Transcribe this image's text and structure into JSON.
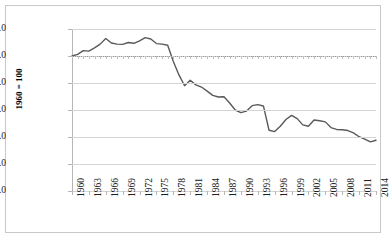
{
  "chart_data": {
    "type": "line",
    "title": "",
    "subtitle": "",
    "xlabel": "",
    "ylabel": "1960 = 100",
    "ylim": [
      50.0,
      110.0
    ],
    "xlim": [
      1960,
      2014
    ],
    "grid": true,
    "legend": false,
    "legend_position": "none",
    "ytick_labels": [
      "110.0",
      "100.0",
      "90.0",
      "80.0",
      "70.0",
      "60.0",
      "50.0"
    ],
    "ytick_values": [
      110.0,
      100.0,
      90.0,
      80.0,
      70.0,
      60.0,
      50.0
    ],
    "xtick_labels": [
      "1960",
      "1963",
      "1966",
      "1969",
      "1972",
      "1975",
      "1978",
      "1981",
      "1984",
      "1987",
      "1990",
      "1993",
      "1996",
      "1999",
      "2002",
      "2005",
      "2008",
      "2011",
      "2014"
    ],
    "xtick_values": [
      1960,
      1963,
      1966,
      1969,
      1972,
      1975,
      1978,
      1981,
      1984,
      1987,
      1990,
      1993,
      1996,
      1999,
      2002,
      2005,
      2008,
      2011,
      2014
    ],
    "reference_line": {
      "value": 100.0,
      "style": "dotted"
    },
    "line_color": "#5a5a5a",
    "series": [
      {
        "name": "index",
        "x": [
          1960,
          1961,
          1962,
          1963,
          1964,
          1965,
          1966,
          1967,
          1968,
          1969,
          1970,
          1971,
          1972,
          1973,
          1974,
          1975,
          1976,
          1977,
          1978,
          1979,
          1980,
          1981,
          1982,
          1983,
          1984,
          1985,
          1986,
          1987,
          1988,
          1989,
          1990,
          1991,
          1992,
          1993,
          1994,
          1995,
          1996,
          1997,
          1998,
          1999,
          2000,
          2001,
          2002,
          2003,
          2004,
          2005,
          2006,
          2007,
          2008,
          2009,
          2010,
          2011,
          2012,
          2013,
          2014
        ],
        "values": [
          100.0,
          100.6,
          102.0,
          101.8,
          103.0,
          104.4,
          106.5,
          104.8,
          104.4,
          104.3,
          105.0,
          104.7,
          105.6,
          106.8,
          106.3,
          104.6,
          104.4,
          104.0,
          98.0,
          93.0,
          89.0,
          91.0,
          89.3,
          88.5,
          87.0,
          85.4,
          84.8,
          84.9,
          82.6,
          80.0,
          79.0,
          79.6,
          81.6,
          82.0,
          81.5,
          72.5,
          72.0,
          74.0,
          76.5,
          78.0,
          76.8,
          74.5,
          74.0,
          76.3,
          76.0,
          75.6,
          73.5,
          72.8,
          72.7,
          72.4,
          71.5,
          70.1,
          69.2,
          68.2,
          68.8
        ]
      }
    ]
  }
}
